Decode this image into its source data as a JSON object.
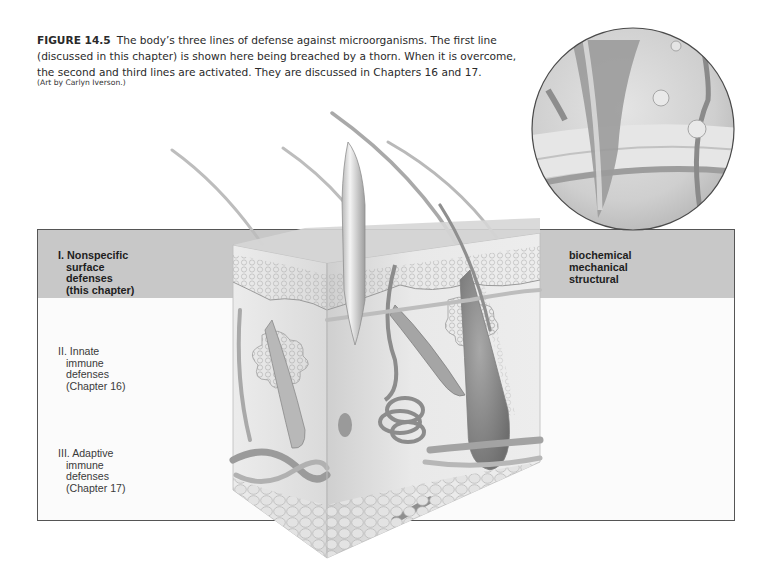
{
  "figure": {
    "label": "FIGURE 14.5",
    "caption_lines": [
      "The body’s three lines of defense against microorganisms. The first line",
      "(discussed in this chapter) is shown here being breached by a thorn. When it is overcome,",
      "the second and third lines are activated. They are discussed in Chapters 16 and 17."
    ],
    "credit": "(Art by Carlyn Iverson.)"
  },
  "defense_lines": [
    {
      "level": "I.",
      "lines": [
        "Nonspecific",
        "surface",
        "defenses",
        "(this chapter)"
      ],
      "emphasis": "bold"
    },
    {
      "level": "II.",
      "lines": [
        "Innate",
        "immune",
        "defenses",
        "(Chapter 16)"
      ],
      "emphasis": "normal"
    },
    {
      "level": "III.",
      "lines": [
        "Adaptive",
        "immune",
        "defenses",
        "(Chapter 17)"
      ],
      "emphasis": "normal"
    }
  ],
  "surface_defense_types": [
    "biochemical",
    "mechanical",
    "structural"
  ],
  "illustration": {
    "subject": "skin-cross-section-with-thorn",
    "inset": "magnified-thorn-puncture",
    "colors": {
      "band": "#c8c8c8",
      "panel_border": "#555555",
      "skin_light": "#e6e6e6",
      "skin_mid": "#bdbdbd",
      "skin_dark": "#8a8a8a"
    }
  }
}
